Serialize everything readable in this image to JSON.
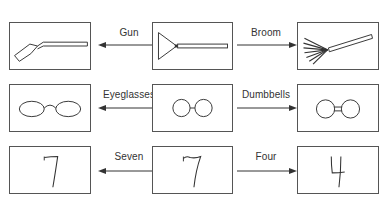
{
  "rows": [
    {
      "left": {
        "drawing": "gun-drawing"
      },
      "center": {
        "drawing": "ambiguous-gun-broom-drawing"
      },
      "right": {
        "drawing": "broom-drawing"
      },
      "left_label": "Gun",
      "right_label": "Broom"
    },
    {
      "left": {
        "drawing": "eyeglasses-drawing"
      },
      "center": {
        "drawing": "ambiguous-eyeglasses-dumbbells-drawing"
      },
      "right": {
        "drawing": "dumbbells-drawing"
      },
      "left_label": "Eyeglasses",
      "right_label": "Dumbbells"
    },
    {
      "left": {
        "drawing": "seven-drawing",
        "glyph": "7"
      },
      "center": {
        "drawing": "ambiguous-seven-four-drawing"
      },
      "right": {
        "drawing": "four-drawing",
        "glyph": "4"
      },
      "left_label": "Seven",
      "right_label": "Four"
    }
  ],
  "colors": {
    "stroke": "#333333",
    "border": "#555555",
    "text": "#333333"
  }
}
